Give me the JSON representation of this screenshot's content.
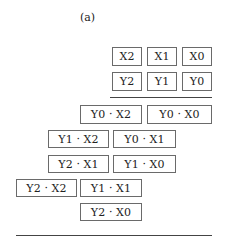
{
  "caption": "(a)",
  "multiplicand": [
    "X2",
    "X1",
    "X0"
  ],
  "multiplier": [
    "Y2",
    "Y1",
    "Y0"
  ],
  "partial_products": {
    "row1": [
      "Y0 · X2",
      "Y0 · X0"
    ],
    "row2": [
      "Y1 · X2",
      "Y0 · X1"
    ],
    "row3": [
      "Y2 · X1",
      "Y1 · X0"
    ],
    "row4": [
      "Y2 · X2",
      "Y1 · X1"
    ],
    "row5": [
      "Y2 · X0"
    ]
  }
}
